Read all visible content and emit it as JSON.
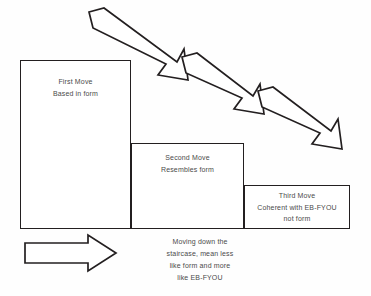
{
  "diagram": {
    "background_color": "#fefefe",
    "stroke_color": "#231f20",
    "text_color": "#4a4a4a"
  },
  "steps": [
    {
      "id": "first-move",
      "heading": "First Move",
      "description": "Based in form"
    },
    {
      "id": "second-move",
      "heading": "Second Move",
      "description": "Resembles  form"
    },
    {
      "id": "third-move",
      "heading": "Third Move",
      "description": "Coherent with EB-FYOU",
      "description2": "not form"
    }
  ],
  "caption": {
    "line1": "Moving down the",
    "line2": "staircase, mean less",
    "line3": "like form and more",
    "line4": "like EB-FYOU"
  },
  "arrows": {
    "diagonal_1": "descending-arrow-1",
    "diagonal_2": "descending-arrow-2",
    "diagonal_3": "descending-arrow-3",
    "horizontal": "progression-arrow-right"
  }
}
